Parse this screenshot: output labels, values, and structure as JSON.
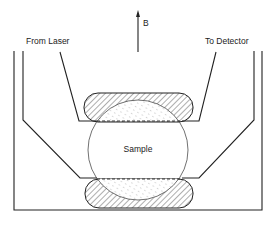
{
  "figure": {
    "type": "schematic",
    "labels": {
      "field": "B",
      "source": "From Laser",
      "output": "To Detector",
      "sample": "Sample"
    },
    "elements": [
      {
        "name": "sample",
        "shape": "circle"
      },
      {
        "name": "top-pad",
        "shape": "rounded-rect",
        "fill": "hatched"
      },
      {
        "name": "bottom-pad",
        "shape": "rounded-rect",
        "fill": "hatched"
      },
      {
        "name": "magnetic-field-arrow",
        "direction": "up"
      }
    ],
    "colors": {
      "ink": "#222222",
      "background": "#ffffff"
    }
  }
}
